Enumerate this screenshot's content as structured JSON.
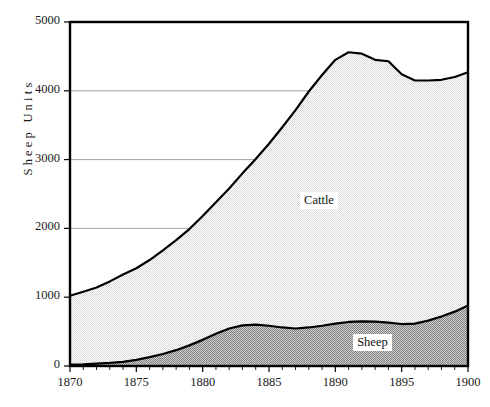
{
  "chart_data": {
    "type": "area",
    "stacked": true,
    "title": "",
    "xlabel": "",
    "ylabel": "Sheep Units",
    "xlim": [
      1870,
      1900
    ],
    "ylim": [
      0,
      5000
    ],
    "xticks": [
      1870,
      1875,
      1880,
      1885,
      1890,
      1895,
      1900
    ],
    "xtick_labels": [
      "1870",
      "1875",
      "1880",
      "1885",
      "1890",
      "1895",
      "1900"
    ],
    "x_minor_tick_step": 1,
    "yticks": [
      0,
      1000,
      2000,
      3000,
      4000,
      5000
    ],
    "ytick_labels": [
      "0",
      "1000",
      "2000",
      "3000",
      "4000",
      "5000"
    ],
    "grid": "horizontal",
    "gridlines_at": [
      1000,
      2000,
      3000,
      4000
    ],
    "legend": "inline-annotations",
    "x": [
      1870,
      1871,
      1872,
      1873,
      1874,
      1875,
      1876,
      1877,
      1878,
      1879,
      1880,
      1881,
      1882,
      1883,
      1884,
      1885,
      1886,
      1887,
      1888,
      1889,
      1890,
      1891,
      1892,
      1893,
      1894,
      1895,
      1896,
      1897,
      1898,
      1899,
      1900
    ],
    "series": [
      {
        "name": "Sheep",
        "fill_color": "#a8a8a8",
        "values": [
          20,
          25,
          35,
          45,
          60,
          90,
          130,
          175,
          230,
          300,
          380,
          470,
          545,
          590,
          600,
          585,
          560,
          545,
          560,
          585,
          615,
          640,
          650,
          645,
          630,
          610,
          615,
          660,
          720,
          790,
          880
        ]
      },
      {
        "name": "Cattle",
        "fill_color": "#ebebeb",
        "stack_top_values": [
          1020,
          1080,
          1140,
          1230,
          1330,
          1420,
          1540,
          1680,
          1830,
          1990,
          2180,
          2380,
          2580,
          2800,
          3010,
          3230,
          3470,
          3720,
          3990,
          4230,
          4450,
          4560,
          4540,
          4450,
          4430,
          4240,
          4150,
          4150,
          4160,
          4200,
          4270
        ]
      }
    ],
    "annotations": [
      {
        "text": "Cattle",
        "x": 1889,
        "y": 2400
      },
      {
        "text": "Sheep",
        "x": 1893,
        "y": 330
      }
    ],
    "line_color": "#000000",
    "frame_color": "#000000",
    "gridline_color": "#999999"
  },
  "plot": {
    "left_px": 70,
    "right_px": 468,
    "top_px": 22,
    "bottom_px": 366
  }
}
